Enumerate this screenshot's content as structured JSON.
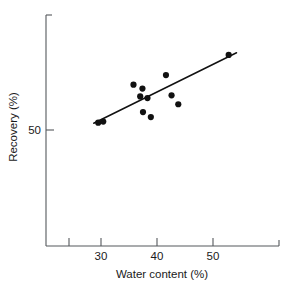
{
  "chart_data": {
    "type": "scatter",
    "title": "",
    "xlabel": "Water content (%)",
    "ylabel": "Recovery (%)",
    "xlim": [
      22,
      58
    ],
    "ylim": [
      40,
      80
    ],
    "xticks": [
      30,
      40,
      50
    ],
    "xtick_labels": [
      "30",
      "40",
      "50"
    ],
    "yticks": [
      50
    ],
    "ytick_labels": [
      "50"
    ],
    "grid": false,
    "legend": "none",
    "points": [
      {
        "x": 29.5,
        "y": 51.3
      },
      {
        "x": 30.4,
        "y": 51.5
      },
      {
        "x": 35.8,
        "y": 58.1
      },
      {
        "x": 37.4,
        "y": 57.4
      },
      {
        "x": 37.5,
        "y": 53.2
      },
      {
        "x": 37.0,
        "y": 56.0
      },
      {
        "x": 38.3,
        "y": 55.7
      },
      {
        "x": 41.6,
        "y": 59.8
      },
      {
        "x": 42.6,
        "y": 56.2
      },
      {
        "x": 43.8,
        "y": 54.6
      },
      {
        "x": 38.9,
        "y": 52.3
      },
      {
        "x": 52.8,
        "y": 63.4
      }
    ],
    "fit_line": {
      "label": "least-squares fit",
      "x_start": 28.7,
      "y_start": 51.2,
      "x_end": 54.2,
      "y_end": 63.8
    },
    "axes_pixels": {
      "x_zero_px": 101,
      "x_units_per_px": 0.17857,
      "y_fifty_px": 130,
      "plot_left": 46,
      "plot_right": 279,
      "plot_top": 15,
      "plot_bottom": 246
    }
  },
  "labels": {
    "x_axis_title": "Water content (%)",
    "y_axis_title": "Recovery (%)",
    "x_tick_30": "30",
    "x_tick_40": "40",
    "x_tick_50": "50",
    "y_tick_50": "50"
  },
  "colors": {
    "axis": "#55585c",
    "point": "#111111",
    "line": "#111111",
    "background": "#ffffff",
    "text": "#1a1a1a"
  }
}
